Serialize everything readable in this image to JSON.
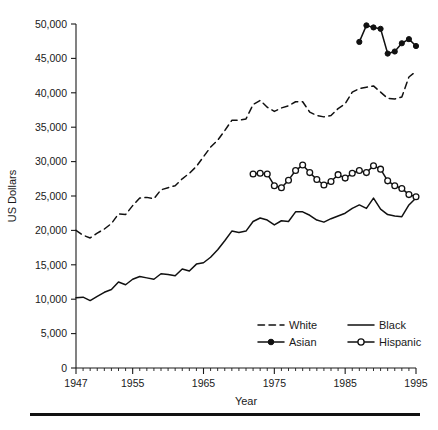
{
  "figure": {
    "background": "#ffffff",
    "ink_color": "#111111"
  },
  "axes": {
    "y_title": "US Dollars",
    "x_title": "Year",
    "y_ticks": [
      "0",
      "5,000",
      "10,000",
      "15,000",
      "20,000",
      "25,000",
      "30,000",
      "35,000",
      "40,000",
      "45,000",
      "50,000"
    ],
    "x_ticks": [
      "1947",
      "1955",
      "1965",
      "1975",
      "1985",
      "1995"
    ]
  },
  "legend": {
    "items": [
      {
        "label": "White",
        "style": "dashed",
        "marker": "none"
      },
      {
        "label": "Black",
        "style": "solid",
        "marker": "none"
      },
      {
        "label": "Asian",
        "style": "solid-point",
        "marker": "filled"
      },
      {
        "label": "Hispanic",
        "style": "solid-point",
        "marker": "open"
      }
    ]
  },
  "chart_data": {
    "type": "line",
    "title": "",
    "xlabel": "Year",
    "ylabel": "US Dollars",
    "xlim": [
      1947,
      1995
    ],
    "ylim": [
      0,
      50000
    ],
    "ytick_step": 5000,
    "grid": false,
    "legend_position": "inside-bottom-right",
    "x_tick_values": [
      1947,
      1955,
      1965,
      1975,
      1985,
      1995
    ],
    "y_tick_values": [
      0,
      5000,
      10000,
      15000,
      20000,
      25000,
      30000,
      35000,
      40000,
      45000,
      50000
    ],
    "series": [
      {
        "name": "White",
        "line_style": "dashed",
        "marker": "none",
        "x": [
          1947,
          1948,
          1949,
          1950,
          1951,
          1952,
          1953,
          1954,
          1955,
          1956,
          1957,
          1958,
          1959,
          1960,
          1961,
          1962,
          1963,
          1964,
          1965,
          1966,
          1967,
          1968,
          1969,
          1970,
          1971,
          1972,
          1973,
          1974,
          1975,
          1976,
          1977,
          1978,
          1979,
          1980,
          1981,
          1982,
          1983,
          1984,
          1985,
          1986,
          1987,
          1988,
          1989,
          1990,
          1991,
          1992,
          1993,
          1994,
          1995
        ],
        "y": [
          20000,
          19300,
          18900,
          19600,
          20200,
          21000,
          22400,
          22300,
          23600,
          24700,
          24800,
          24600,
          25900,
          26200,
          26500,
          27500,
          28300,
          29300,
          30700,
          32100,
          33100,
          34500,
          36000,
          36000,
          36200,
          38300,
          38900,
          37900,
          37300,
          37800,
          38100,
          38700,
          38700,
          37200,
          36700,
          36500,
          36700,
          37700,
          38400,
          40100,
          40600,
          40800,
          41000,
          40100,
          39200,
          39100,
          39400,
          42300,
          43100
        ]
      },
      {
        "name": "Black",
        "line_style": "solid",
        "marker": "none",
        "x": [
          1947,
          1948,
          1949,
          1950,
          1951,
          1952,
          1953,
          1954,
          1955,
          1956,
          1957,
          1958,
          1959,
          1960,
          1961,
          1962,
          1963,
          1964,
          1965,
          1966,
          1967,
          1968,
          1969,
          1970,
          1971,
          1972,
          1973,
          1974,
          1975,
          1976,
          1977,
          1978,
          1979,
          1980,
          1981,
          1982,
          1983,
          1984,
          1985,
          1986,
          1987,
          1988,
          1989,
          1990,
          1991,
          1992,
          1993,
          1994,
          1995
        ],
        "y": [
          10200,
          10300,
          9800,
          10400,
          11000,
          11400,
          12500,
          12100,
          12900,
          13300,
          13100,
          12900,
          13700,
          13600,
          13400,
          14400,
          14100,
          15100,
          15300,
          16100,
          17200,
          18500,
          19900,
          19700,
          19900,
          21300,
          21800,
          21500,
          20800,
          21400,
          21300,
          22700,
          22700,
          22200,
          21500,
          21200,
          21700,
          22100,
          22500,
          23200,
          23700,
          23200,
          24700,
          23100,
          22300,
          22100,
          22000,
          23700,
          24700
        ]
      },
      {
        "name": "Asian",
        "line_style": "solid",
        "marker": "filled",
        "x": [
          1987,
          1988,
          1989,
          1990,
          1991,
          1992,
          1993,
          1994,
          1995
        ],
        "y": [
          47400,
          49800,
          49500,
          49300,
          45700,
          46000,
          47200,
          47800,
          46800
        ]
      },
      {
        "name": "Hispanic",
        "line_style": "solid",
        "marker": "open",
        "x": [
          1972,
          1973,
          1974,
          1975,
          1976,
          1977,
          1978,
          1979,
          1980,
          1981,
          1982,
          1983,
          1984,
          1985,
          1986,
          1987,
          1988,
          1989,
          1990,
          1991,
          1992,
          1993,
          1994,
          1995
        ],
        "y": [
          28200,
          28300,
          28200,
          26500,
          26200,
          27300,
          28700,
          29500,
          28400,
          27400,
          26600,
          27100,
          28100,
          27600,
          28300,
          28700,
          28400,
          29400,
          28900,
          27200,
          26500,
          26100,
          25200,
          24900
        ]
      }
    ]
  }
}
